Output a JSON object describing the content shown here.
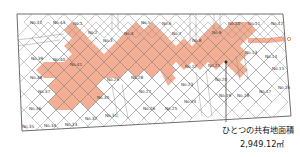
{
  "map": {
    "title": "land-subdivision-plan",
    "colors": {
      "shared_land_fill": "#F4AE94",
      "plot_outline": "#7a7a7a",
      "boundary": "#555555",
      "label_text": "#3a3a3a",
      "callout_line": "#3a2a20",
      "marker_dot": "#E8883C",
      "background": "#FFFFFF"
    },
    "plots": [
      {
        "id": "1",
        "label": "No.1",
        "x": 73,
        "y": 25
      },
      {
        "id": "2",
        "label": "No.2",
        "x": 88,
        "y": 34
      },
      {
        "id": "3",
        "label": "No.3",
        "x": 103,
        "y": 42
      },
      {
        "id": "4",
        "label": "No.4",
        "x": 124,
        "y": 35
      },
      {
        "id": "5",
        "label": "No.5",
        "x": 141,
        "y": 24
      },
      {
        "id": "6",
        "label": "No.6",
        "x": 162,
        "y": 25
      },
      {
        "id": "7",
        "label": "No.7",
        "x": 172,
        "y": 35
      },
      {
        "id": "8",
        "label": "No.8",
        "x": 192,
        "y": 42
      },
      {
        "id": "9",
        "label": "No.9",
        "x": 212,
        "y": 34
      },
      {
        "id": "10",
        "label": "No.10",
        "x": 228,
        "y": 25
      },
      {
        "id": "11",
        "label": "No.11",
        "x": 248,
        "y": 25
      },
      {
        "id": "12",
        "label": "No.12",
        "x": 271,
        "y": 25
      },
      {
        "id": "13",
        "label": "No.13",
        "x": 245,
        "y": 54
      },
      {
        "id": "14",
        "label": "No.14",
        "x": 265,
        "y": 58
      },
      {
        "id": "15",
        "label": "No.15",
        "x": 272,
        "y": 70
      },
      {
        "id": "16",
        "label": "No.16",
        "x": 278,
        "y": 89
      },
      {
        "id": "17",
        "label": "No.17",
        "x": 259,
        "y": 93
      },
      {
        "id": "18",
        "label": "No.18",
        "x": 237,
        "y": 97
      },
      {
        "id": "19",
        "label": "No.19",
        "x": 219,
        "y": 97
      },
      {
        "id": "20",
        "label": "No.20",
        "x": 215,
        "y": 81
      },
      {
        "id": "21",
        "label": "No.21",
        "x": 208,
        "y": 67
      },
      {
        "id": "22",
        "label": "No.22",
        "x": 185,
        "y": 68
      },
      {
        "id": "23",
        "label": "No.23",
        "x": 181,
        "y": 86
      },
      {
        "id": "24",
        "label": "No.24",
        "x": 184,
        "y": 103
      },
      {
        "id": "25",
        "label": "No.25",
        "x": 165,
        "y": 110
      },
      {
        "id": "26",
        "label": "No.26",
        "x": 143,
        "y": 110
      },
      {
        "id": "27",
        "label": "No.27",
        "x": 139,
        "y": 93
      },
      {
        "id": "28",
        "label": "No.28",
        "x": 131,
        "y": 79
      },
      {
        "id": "29",
        "label": "No.29",
        "x": 107,
        "y": 81
      },
      {
        "id": "30",
        "label": "No.30",
        "x": 97,
        "y": 99
      },
      {
        "id": "31",
        "label": "No.31",
        "x": 105,
        "y": 117
      },
      {
        "id": "32",
        "label": "No.32",
        "x": 85,
        "y": 120
      },
      {
        "id": "33",
        "label": "No.33",
        "x": 65,
        "y": 126
      },
      {
        "id": "34",
        "label": "No.34",
        "x": 44,
        "y": 127
      },
      {
        "id": "35",
        "label": "No.35",
        "x": 22,
        "y": 128
      },
      {
        "id": "36",
        "label": "No.36",
        "x": 29,
        "y": 110
      },
      {
        "id": "37",
        "label": "No.37",
        "x": 38,
        "y": 93
      },
      {
        "id": "38",
        "label": "No.38",
        "x": 30,
        "y": 79
      },
      {
        "id": "39",
        "label": "No.39",
        "x": 31,
        "y": 60
      },
      {
        "id": "40",
        "label": "No.40",
        "x": 53,
        "y": 61
      },
      {
        "id": "41",
        "label": "No.41",
        "x": 70,
        "y": 66
      },
      {
        "id": "42",
        "label": "No.42",
        "x": 30,
        "y": 24
      },
      {
        "id": "43",
        "label": "No.43",
        "x": 53,
        "y": 24
      }
    ],
    "annotation": {
      "name": "shared-land-area-callout",
      "title": "ひとつの共有地面積",
      "value": "2,949.12㎡",
      "pointer_x": 226,
      "pointer_y": 62,
      "pointer_end_y": 122
    },
    "edge_marker": {
      "name": "east-boundary-marker",
      "x": 289,
      "y": 39
    }
  }
}
